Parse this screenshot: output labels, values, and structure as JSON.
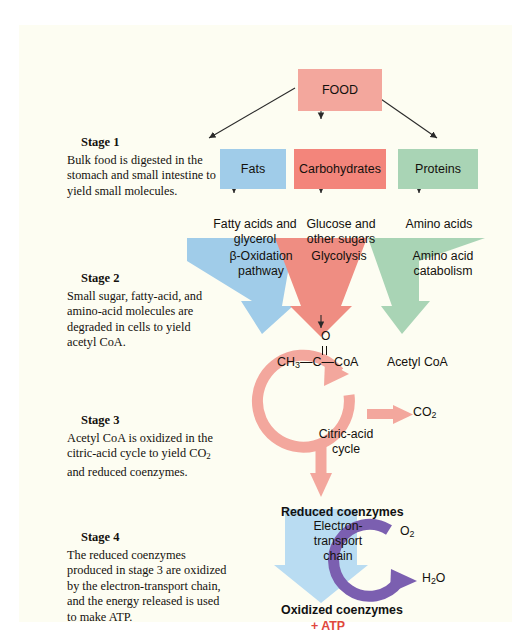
{
  "figure": {
    "colors": {
      "salmon": "#f3a79d",
      "salmon_dark": "#f3857b",
      "blue": "#a0cce9",
      "green": "#a9d4b5",
      "purple": "#7b5fb0",
      "red_text": "#e0473b",
      "panel_bg": "#fdfdf2"
    }
  },
  "stages": [
    {
      "head": "Stage 1",
      "body": "Bulk food is digested in the stomach and small intestine to yield small molecules."
    },
    {
      "head": "Stage 2",
      "body": "Small sugar, fatty-acid, and amino-acid molecules are degraded in cells to yield acetyl CoA."
    },
    {
      "head": "Stage 3",
      "body": "Acetyl CoA is oxidized in the citric-acid cycle to yield CO2 and reduced coenzymes."
    },
    {
      "head": "Stage 4",
      "body": "The reduced coenzymes produced in stage 3 are oxidized by the electron-transport chain, and the energy released is used to make ATP."
    }
  ],
  "boxes": {
    "food": "FOOD",
    "fats": "Fats",
    "carbohydrates": "Carbohydrates",
    "proteins": "Proteins"
  },
  "products": {
    "fatty": "Fatty acids and glycerol",
    "glucose": "Glucose and other sugars",
    "amino": "Amino acids"
  },
  "pathways": {
    "beta_oxidation": "β-Oxidation pathway",
    "glycolysis": "Glycolysis",
    "amino_catabolism": "Amino acid catabolism",
    "citric_acid_cycle": "Citric-acid cycle",
    "electron_transport": "Electron-transport chain"
  },
  "molecules": {
    "acetyl_label": "Acetyl CoA",
    "acetyl_structure_o": "O",
    "acetyl_structure_chain": "CH3—C—CoA",
    "co2": "CO2",
    "o2": "O2",
    "h2o": "H2O",
    "reduced_coenzymes": "Reduced coenzymes",
    "oxidized_coenzymes": "Oxidized coenzymes",
    "atp": "+ ATP"
  }
}
